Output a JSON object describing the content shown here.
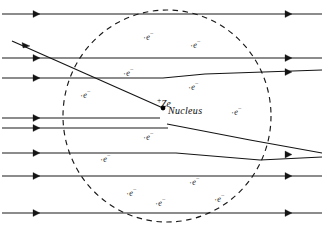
{
  "figure": {
    "background_color": "#ffffff",
    "ink_color": "#141414",
    "width": 324,
    "height": 230
  },
  "nucleus": {
    "charge_label": "+Ze",
    "charge_sign": "+",
    "charge_text": "Ze",
    "name_label": "Nucleus",
    "x": 163,
    "y": 108,
    "dot_radius": 2.4
  },
  "atom_boundary": {
    "shape": "dashed-circle",
    "center_x": 167,
    "center_y": 116,
    "radius_x": 104,
    "radius_y": 106,
    "dash_pattern": "5.5 4.5"
  },
  "electrons": {
    "symbol": "e",
    "charge_superscript": "−",
    "marker_dot": "·",
    "count": 14,
    "items": [
      {
        "label": "e",
        "x": 143,
        "y": 30
      },
      {
        "label": "e",
        "x": 190,
        "y": 38
      },
      {
        "label": "e",
        "x": 123,
        "y": 66
      },
      {
        "label": "e",
        "x": 188,
        "y": 80
      },
      {
        "label": "e",
        "x": 80,
        "y": 88
      },
      {
        "label": "e",
        "x": 231,
        "y": 105
      },
      {
        "label": "e",
        "x": 143,
        "y": 130
      },
      {
        "label": "e",
        "x": 100,
        "y": 152
      },
      {
        "label": "e",
        "x": 189,
        "y": 175
      },
      {
        "label": "e",
        "x": 126,
        "y": 186
      },
      {
        "label": "e",
        "x": 155,
        "y": 196
      },
      {
        "label": "e",
        "x": 214,
        "y": 192
      },
      {
        "label": "e",
        "x": 60,
        "y": 120
      },
      {
        "label": "e",
        "x": 248,
        "y": 147
      }
    ]
  },
  "beam_lines": {
    "description": "Incident alpha-particle beam lines with direction arrowheads",
    "count": 8,
    "arrow_positions": [
      "left",
      "right"
    ],
    "y_values": [
      14,
      58,
      78,
      118,
      128,
      153,
      176,
      213
    ]
  },
  "scattered_paths": {
    "description": "Deflected alpha-particle trajectories near the nucleus",
    "count": 3,
    "paths": [
      {
        "name": "large-angle-deflection",
        "note": "steeply deflected incoming path ending at nucleus"
      },
      {
        "name": "small-angle-deflection-upper",
        "note": "slightly deflected path continuing right"
      },
      {
        "name": "small-angle-deflection-lower",
        "note": "slightly deflected path continuing right"
      }
    ]
  }
}
